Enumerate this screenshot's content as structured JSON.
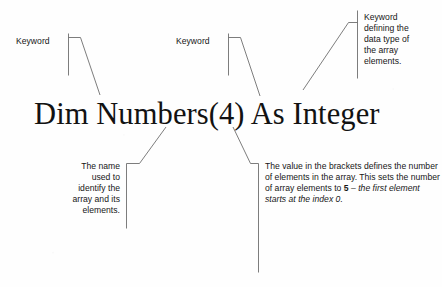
{
  "figure": {
    "background_color": "#fefefe",
    "ink_color": "#161616",
    "leader_line_color": "#6e6e6e"
  },
  "code": {
    "statement": "Dim Numbers(4) As Integer"
  },
  "annotations": {
    "keyword_dim": {
      "text": "Keyword",
      "align": "right",
      "bar_side": "right"
    },
    "keyword_as": {
      "text": "Keyword",
      "align": "right",
      "bar_side": "right"
    },
    "data_type": {
      "text": "Keyword\ndefining the\ndata type of\nthe array\nelements.",
      "align": "left",
      "bar_side": "left"
    },
    "array_name": {
      "text": "The name\nused to\nidentify the\narray and its\nelements.",
      "align": "right",
      "bar_side": "right"
    },
    "element_count": {
      "lead_text": "The value in the brackets defines the number of elements in the array. This sets the number of array elements to ",
      "bold_value": "5",
      "dash": " – ",
      "italic_text": "the first element starts at the index 0.",
      "align": "left",
      "bar_side": "left"
    }
  }
}
